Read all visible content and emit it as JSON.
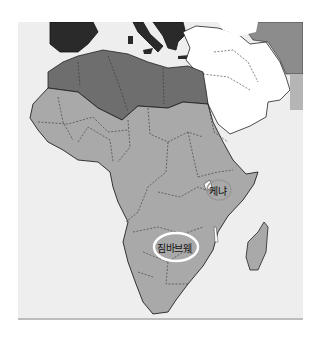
{
  "map": {
    "region": "Africa",
    "labels": [
      {
        "id": "kenya",
        "text": "케냐"
      },
      {
        "id": "zimbabwe",
        "text": "짐바브웨"
      }
    ],
    "colors": {
      "sea": "#eeeeee",
      "africa_sub_saharan": "#a9a9a9",
      "north_africa": "#6e6e6e",
      "southern_europe": "#2a2a2a",
      "middle_east": "#ffffff",
      "east_region": "#8c8c8c",
      "highlight_ring": "#ffffff"
    }
  }
}
